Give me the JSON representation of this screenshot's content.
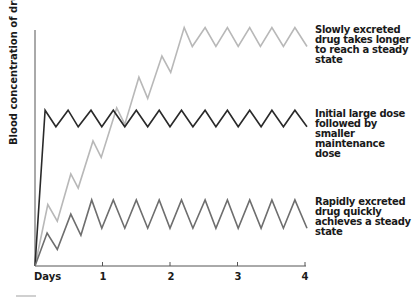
{
  "chart_data": {
    "type": "line",
    "title": "",
    "xlabel": "Days",
    "ylabel": "Blood concentration of drugs",
    "xlim": [
      0,
      4
    ],
    "ylim": [
      0,
      100
    ],
    "x_ticks": [
      "1",
      "2",
      "3",
      "4"
    ],
    "x_tick_values": [
      1,
      2,
      3,
      4
    ],
    "grid": false,
    "legend_position": "right (inline annotations)",
    "series": [
      {
        "name": "Slowly excreted drug takes longer to reach a steady state",
        "color": "#b8b8b8",
        "points": [
          [
            0,
            0
          ],
          [
            0.19,
            26
          ],
          [
            0.33,
            19
          ],
          [
            0.53,
            39
          ],
          [
            0.64,
            33
          ],
          [
            0.86,
            53
          ],
          [
            0.98,
            46
          ],
          [
            1.21,
            67
          ],
          [
            1.33,
            60
          ],
          [
            1.54,
            80
          ],
          [
            1.67,
            71
          ],
          [
            1.88,
            89
          ],
          [
            2.01,
            82
          ],
          [
            2.21,
            101
          ],
          [
            2.33,
            93
          ],
          [
            2.52,
            101
          ],
          [
            2.68,
            93
          ],
          [
            2.85,
            101
          ],
          [
            3.01,
            93
          ],
          [
            3.18,
            101
          ],
          [
            3.34,
            93
          ],
          [
            3.51,
            101
          ],
          [
            3.68,
            93
          ],
          [
            3.85,
            101
          ],
          [
            4.03,
            93
          ]
        ]
      },
      {
        "name": "Initial large dose followed by smaller maintenance dose",
        "color": "#2a2a2a",
        "points": [
          [
            0,
            0
          ],
          [
            0.15,
            66
          ],
          [
            0.31,
            59
          ],
          [
            0.49,
            66
          ],
          [
            0.64,
            59
          ],
          [
            0.83,
            66
          ],
          [
            0.99,
            59
          ],
          [
            1.16,
            66
          ],
          [
            1.33,
            59
          ],
          [
            1.5,
            66
          ],
          [
            1.67,
            59
          ],
          [
            1.84,
            66
          ],
          [
            2.0,
            59
          ],
          [
            2.17,
            66
          ],
          [
            2.34,
            59
          ],
          [
            2.52,
            66
          ],
          [
            2.68,
            59
          ],
          [
            2.85,
            66
          ],
          [
            3.01,
            59
          ],
          [
            3.18,
            66
          ],
          [
            3.35,
            59
          ],
          [
            3.51,
            66
          ],
          [
            3.68,
            59
          ],
          [
            3.85,
            66
          ],
          [
            4.03,
            59
          ]
        ]
      },
      {
        "name": "Rapidly excreted drug quickly achieves a steady state",
        "color": "#6e6e6e",
        "points": [
          [
            0,
            0
          ],
          [
            0.18,
            14
          ],
          [
            0.33,
            7
          ],
          [
            0.53,
            22
          ],
          [
            0.68,
            13
          ],
          [
            0.84,
            28
          ],
          [
            0.99,
            16
          ],
          [
            1.16,
            28
          ],
          [
            1.33,
            16
          ],
          [
            1.5,
            28
          ],
          [
            1.67,
            16
          ],
          [
            1.84,
            28
          ],
          [
            2.0,
            16
          ],
          [
            2.17,
            28
          ],
          [
            2.34,
            16
          ],
          [
            2.52,
            28
          ],
          [
            2.68,
            16
          ],
          [
            2.85,
            28
          ],
          [
            3.01,
            16
          ],
          [
            3.18,
            28
          ],
          [
            3.35,
            16
          ],
          [
            3.51,
            28
          ],
          [
            3.68,
            16
          ],
          [
            3.85,
            28
          ],
          [
            4.03,
            16
          ]
        ]
      }
    ],
    "annotations": [
      {
        "text": "Slowly excreted drug takes longer to reach a steady state",
        "series": 0
      },
      {
        "text": "Initial large dose followed by smaller maintenance dose",
        "series": 1
      },
      {
        "text": "Rapidly excreted drug quickly achieves a steady state",
        "series": 2
      }
    ]
  },
  "labels": {
    "ylabel": "Blood concentration of drugs",
    "days": "Days",
    "ticks": [
      "1",
      "2",
      "3",
      "4"
    ],
    "annot_slow": [
      "Slowly excreted",
      "drug takes longer",
      "to reach a steady",
      "state"
    ],
    "annot_initial": [
      "Initial large dose",
      "followed by smaller",
      "maintenance dose"
    ],
    "annot_rapid": [
      "Rapidly excreted",
      "drug quickly",
      "achieves a steady",
      "state"
    ]
  }
}
